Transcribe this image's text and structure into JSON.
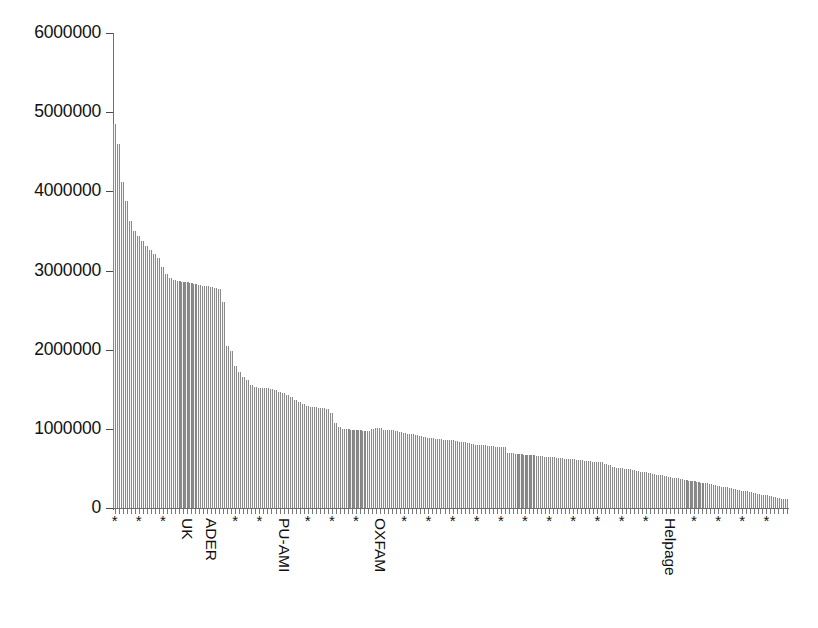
{
  "chart_data": {
    "type": "bar",
    "title": "",
    "subtitle": "",
    "xlabel": "",
    "ylabel": "",
    "ylim": [
      0,
      6000000
    ],
    "xlim": [
      0,
      168
    ],
    "grid": false,
    "legend": null,
    "y_ticks": [
      0,
      1000000,
      2000000,
      3000000,
      4000000,
      5000000,
      6000000
    ],
    "y_tick_labels": [
      "0",
      "1000000",
      "2000000",
      "3000000",
      "4000000",
      "5000000",
      "6000000"
    ],
    "bar_color": "#b4b4b4",
    "bar_edge_color": "#8a8a8a",
    "axis_color": "#6e6e6e",
    "text_color": "#111111",
    "n_bars": 168,
    "sorted": "descending",
    "anonymous_tick_symbol": "*",
    "named_categories": [
      {
        "label": "UK",
        "bar_index": 18
      },
      {
        "label": "ADER",
        "bar_index": 24
      },
      {
        "label": "PU-AMI",
        "bar_index": 42
      },
      {
        "label": "OXFAM",
        "bar_index": 66
      },
      {
        "label": "Helpage",
        "bar_index": 138
      }
    ],
    "tick_label_every_n_bars": 6,
    "categories": [
      "*",
      "*",
      "*",
      "*",
      "*",
      "*",
      "*",
      "*",
      "*",
      "*",
      "*",
      "*",
      "*",
      "*",
      "*",
      "*",
      "*",
      "*",
      "UK",
      "*",
      "*",
      "*",
      "*",
      "*",
      "ADER",
      "*",
      "*",
      "*",
      "*",
      "*",
      "*",
      "*",
      "*",
      "*",
      "*",
      "*",
      "*",
      "*",
      "*",
      "*",
      "*",
      "*",
      "PU-AMI",
      "*",
      "*",
      "*",
      "*",
      "*",
      "*",
      "*",
      "*",
      "*",
      "*",
      "*",
      "*",
      "*",
      "*",
      "*",
      "*",
      "*",
      "*",
      "*",
      "*",
      "*",
      "*",
      "*",
      "OXFAM",
      "*",
      "*",
      "*",
      "*",
      "*",
      "*",
      "*",
      "*",
      "*",
      "*",
      "*",
      "*",
      "*",
      "*",
      "*",
      "*",
      "*",
      "*",
      "*",
      "*",
      "*",
      "*",
      "*",
      "*",
      "*",
      "*",
      "*",
      "*",
      "*",
      "*",
      "*",
      "*",
      "*",
      "*",
      "*",
      "*",
      "*",
      "*",
      "*",
      "*",
      "*",
      "*",
      "*",
      "*",
      "*",
      "*",
      "*",
      "*",
      "*",
      "*",
      "*",
      "*",
      "*",
      "*",
      "*",
      "*",
      "*",
      "*",
      "*",
      "*",
      "*",
      "*",
      "*",
      "*",
      "*",
      "*",
      "*",
      "*",
      "*",
      "*",
      "*",
      "Helpage",
      "*",
      "*",
      "*",
      "*",
      "*",
      "*",
      "*",
      "*",
      "*",
      "*",
      "*",
      "*",
      "*",
      "*",
      "*",
      "*",
      "*",
      "*",
      "*",
      "*",
      "*",
      "*",
      "*",
      "*",
      "*",
      "*",
      "*",
      "*",
      "*"
    ],
    "values": [
      4850000,
      4600000,
      4120000,
      3880000,
      3620000,
      3500000,
      3430000,
      3370000,
      3310000,
      3260000,
      3210000,
      3160000,
      3050000,
      2960000,
      2900000,
      2880000,
      2870000,
      2860000,
      2850000,
      2840000,
      2830000,
      2820000,
      2810000,
      2800000,
      2790000,
      2780000,
      2770000,
      2600000,
      2050000,
      1980000,
      1800000,
      1720000,
      1660000,
      1620000,
      1560000,
      1530000,
      1520000,
      1515000,
      1510000,
      1505000,
      1490000,
      1470000,
      1450000,
      1430000,
      1400000,
      1370000,
      1340000,
      1310000,
      1290000,
      1280000,
      1270000,
      1265000,
      1260000,
      1255000,
      1200000,
      1080000,
      1020000,
      1000000,
      995000,
      990000,
      985000,
      980000,
      975000,
      975000,
      1000000,
      1010000,
      1005000,
      990000,
      985000,
      980000,
      970000,
      960000,
      950000,
      940000,
      930000,
      920000,
      910000,
      900000,
      890000,
      880000,
      875000,
      870000,
      865000,
      860000,
      855000,
      850000,
      840000,
      830000,
      820000,
      810000,
      800000,
      795000,
      790000,
      785000,
      780000,
      775000,
      770000,
      765000,
      700000,
      690000,
      685000,
      680000,
      675000,
      670000,
      665000,
      660000,
      655000,
      650000,
      645000,
      640000,
      635000,
      630000,
      625000,
      620000,
      615000,
      610000,
      605000,
      600000,
      590000,
      585000,
      580000,
      575000,
      560000,
      540000,
      520000,
      505000,
      500000,
      495000,
      490000,
      485000,
      470000,
      460000,
      450000,
      440000,
      430000,
      420000,
      415000,
      405000,
      395000,
      385000,
      375000,
      365000,
      355000,
      345000,
      335000,
      325000,
      320000,
      310000,
      300000,
      290000,
      280000,
      270000,
      260000,
      250000,
      240000,
      230000,
      220000,
      210000,
      200000,
      190000,
      180000,
      170000,
      160000,
      150000,
      140000,
      130000,
      120000,
      110000
    ]
  }
}
